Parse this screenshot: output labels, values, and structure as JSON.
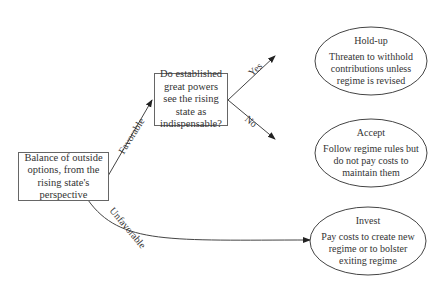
{
  "diagram": {
    "type": "decision-tree",
    "root": {
      "text": "Balance of outside options, from the rising state's perspective"
    },
    "question": {
      "text": "Do established great powers see the rising state as indispensable?"
    },
    "edges": {
      "favorable": "Favorable",
      "unfavorable": "Unfavorable",
      "yes": "Yes",
      "no": "No"
    },
    "outcomes": [
      {
        "title": "Hold-up",
        "text": "Threaten to withhold contributions unless regime is revised"
      },
      {
        "title": "Accept",
        "text": "Follow regime rules but do not pay costs to maintain them"
      },
      {
        "title": "Invest",
        "text": "Pay costs to create new regime or to bolster exiting regime"
      }
    ]
  }
}
